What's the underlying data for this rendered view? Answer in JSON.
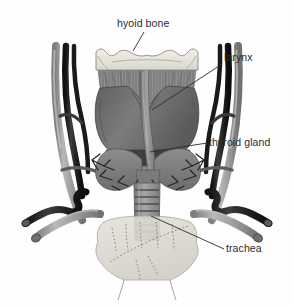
{
  "figure": {
    "background_color": "#fefefe",
    "width": 294,
    "height": 306
  },
  "labels": [
    {
      "id": "hyoid-bone",
      "text": "hyoid bone",
      "text_x": 117,
      "text_y": 27,
      "anchor": "start",
      "leader": "M 144 32 L 133 51"
    },
    {
      "id": "larynx",
      "text": "larynx",
      "text_x": 224,
      "text_y": 61,
      "anchor": "start",
      "leader": "M 222 64 L 152 110"
    },
    {
      "id": "thyroid-gland",
      "text": "thyroid gland",
      "text_x": 209,
      "text_y": 146,
      "anchor": "start",
      "leader": "M 207 143 L 150 152"
    },
    {
      "id": "trachea",
      "text": "trachea",
      "text_x": 226,
      "text_y": 252,
      "anchor": "start",
      "leader": "M 224 249 L 151 216"
    }
  ],
  "structures": [
    {
      "id": "hyoid-bone",
      "name": "hyoid bone",
      "color": "#ebe8e0"
    },
    {
      "id": "thyrohyoid-membrane",
      "name": "thyrohyoid membrane",
      "color": "#8e8e8e"
    },
    {
      "id": "larynx",
      "name": "larynx (thyroid cartilage)",
      "color": "#6f6f6f"
    },
    {
      "id": "thyroid-gland",
      "name": "thyroid gland",
      "color": "#858585"
    },
    {
      "id": "trachea",
      "name": "trachea",
      "color": "#9a9a9a"
    },
    {
      "id": "carotid-artery",
      "name": "common carotid artery",
      "color": "#9e9e9e"
    },
    {
      "id": "jugular-vein",
      "name": "internal jugular vein",
      "color": "#262626"
    },
    {
      "id": "subclavian-artery",
      "name": "subclavian artery",
      "color": "#9e9e9e"
    },
    {
      "id": "subclavian-vein",
      "name": "subclavian vein",
      "color": "#262626"
    },
    {
      "id": "sternum",
      "name": "sternum / manubrium",
      "color": "#dcdcd4"
    }
  ],
  "colors": {
    "bone_pale": "#ebe8e0",
    "bone_outline": "#8a8a82",
    "cartilage_dark": "#6f6f6f",
    "cartilage_mid": "#858585",
    "muscle_gray": "#8e8e8e",
    "vessel_light": "#9e9e9e",
    "vessel_dark": "#262626",
    "sternum_pale": "#dcdcd4",
    "label_text": "#2b2b2b",
    "outline": "#3a3a3a"
  }
}
